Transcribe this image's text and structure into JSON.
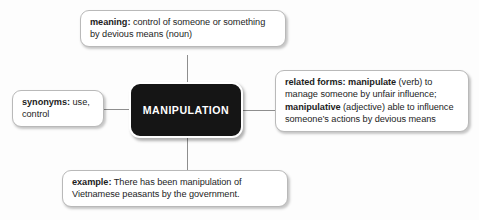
{
  "diagram": {
    "type": "word-web",
    "center": {
      "label": "MANIPULATION",
      "color": "#151515",
      "text_color": "#ffffff"
    },
    "nodes": [
      {
        "id": "meaning",
        "position": "top",
        "heading": "meaning:",
        "body": " control of someone or something by devious means (noun)",
        "full_text": "meaning: control of someone or something by devious means (noun)"
      },
      {
        "id": "synonyms",
        "position": "left",
        "heading": "synonyms:",
        "body": " use, control",
        "full_text": "synonyms: use, control"
      },
      {
        "id": "related-forms",
        "position": "right",
        "heading": "related forms:",
        "segment_1_bold": " manipulate",
        "segment_1_text": " (verb) to manage someone by unfair influence;",
        "segment_2_bold": " manipulative",
        "segment_2_text": " (adjective) able to influence someone’s actions by devious means",
        "full_text": "related forms: manipulate (verb) to manage someone by unfair influence; manipulative (adjective) able to influence someone’s actions by devious means"
      },
      {
        "id": "example",
        "position": "bottom",
        "heading": "example:",
        "body": " There has been manipulation of Vietnamese peasants by the government.",
        "full_text": "example: There has been manipulation of Vietnamese peasants by the government."
      }
    ],
    "connectors": [
      {
        "from": "center",
        "to": "meaning",
        "orientation": "vertical"
      },
      {
        "from": "center",
        "to": "synonyms",
        "orientation": "horizontal"
      },
      {
        "from": "center",
        "to": "related-forms",
        "orientation": "horizontal"
      },
      {
        "from": "center",
        "to": "example",
        "orientation": "vertical"
      }
    ],
    "colors": {
      "background": "#fdfdfd",
      "box_border": "#b9b9b9",
      "connector": "#8e8e8e",
      "text": "#1d1d1d"
    }
  }
}
